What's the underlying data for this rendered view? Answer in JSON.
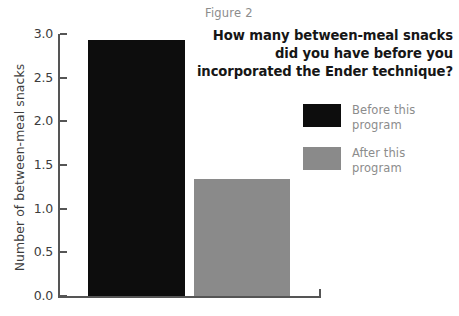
{
  "figure": {
    "label": "Figure 2"
  },
  "chart_data": {
    "type": "bar",
    "title": "How many between-meal snacks did you have before you incorporated the Ender technique?",
    "title_lines": [
      "How many between-meal snacks",
      "did you have before you",
      "incorporated the Ender technique?"
    ],
    "categories": [
      "Before this program",
      "After this program"
    ],
    "values": [
      2.93,
      1.34
    ],
    "xlabel": "",
    "ylabel": "Number of between-meal snacks",
    "ylim": [
      0.0,
      3.0
    ],
    "yticks": [
      "0.0",
      "0.5",
      "1.0",
      "1.5",
      "2.0",
      "2.5",
      "3.0"
    ],
    "ytick_values": [
      0.0,
      0.5,
      1.0,
      1.5,
      2.0,
      2.5,
      3.0
    ],
    "grid": false,
    "legend_position": "right",
    "series": [
      {
        "name": "Before this program",
        "name_lines": [
          "Before this",
          "program"
        ],
        "value": 2.93,
        "color": "#0d0d0d"
      },
      {
        "name": "After this program",
        "name_lines": [
          "After this",
          "program"
        ],
        "value": 1.34,
        "color": "#8a8a8a"
      }
    ]
  },
  "colors": {
    "before_bar": "#0d0d0d",
    "after_bar": "#8a8a8a",
    "axis": "#555555",
    "tick_text": "#3c3c3c",
    "muted_text": "#8c8c8c",
    "title_text": "#161616",
    "background": "#ffffff"
  }
}
